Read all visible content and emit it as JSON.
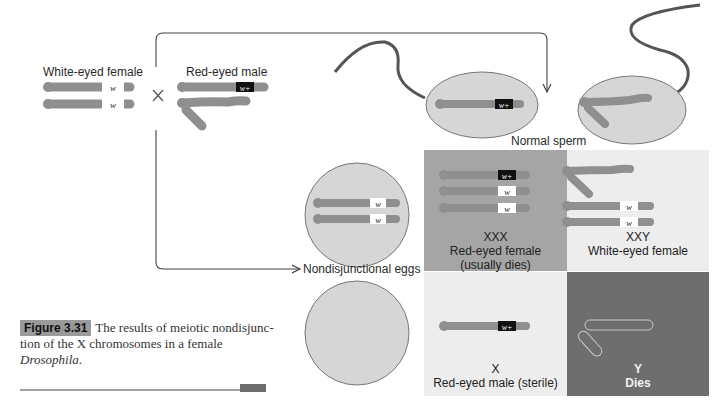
{
  "figure": {
    "parents": {
      "female_label": "White-eyed female",
      "male_label": "Red-eyed male",
      "cross_symbol": "×",
      "female_alleles": [
        "w",
        "w"
      ],
      "male_allele": "w+"
    },
    "sperm_label": "Normal sperm",
    "eggs_label": "Nondisjunctional eggs",
    "sperm_allele": "w+",
    "egg_alleles": [
      "w",
      "w"
    ],
    "grid": [
      {
        "genotype": "XXX",
        "phenotype": "Red-eyed female",
        "note": "(usually dies)",
        "alleles": [
          "w+",
          "w",
          "w"
        ],
        "bg": "#a5a5a5"
      },
      {
        "genotype": "XXY",
        "phenotype": "White-eyed female",
        "note": "",
        "alleles": [
          "w",
          "w"
        ],
        "bg": "#ededed"
      },
      {
        "genotype": "X",
        "phenotype": "Red-eyed male (sterile)",
        "note": "",
        "alleles": [
          "w+"
        ],
        "bg": "#ededed"
      },
      {
        "genotype": "Y",
        "phenotype": "Dies",
        "note": "",
        "alleles": [],
        "bg": "#6e6e6e"
      }
    ]
  },
  "caption": {
    "tag": "Figure 3.31",
    "line1": "The results of meiotic nondisjunc-",
    "line2": "tion of the X chromosomes in a female",
    "species": "Drosophila",
    "period": "."
  },
  "colors": {
    "chromosome": "#8f8f8f",
    "cell_fill": "#d6d6d6",
    "cell_stroke": "#777777",
    "allele_wplus_bg": "#111111",
    "allele_w_bg": "#ffffff",
    "line": "#444444"
  }
}
